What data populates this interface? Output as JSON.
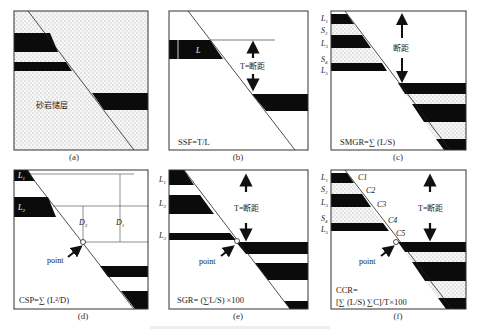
{
  "figure": {
    "panels": [
      {
        "id": "a",
        "caption": "(a)",
        "label": "砂岩储层"
      },
      {
        "id": "b",
        "caption": "(b)",
        "bed_label": "L",
        "throw_label": "T=断距",
        "formula": "SSF=T/L"
      },
      {
        "id": "c",
        "caption": "(c)",
        "layer_labels": [
          "L1",
          "S2",
          "L3",
          "S4",
          "L5"
        ],
        "throw_label": "断距",
        "formula": "SMGR=∑ (L/S)"
      },
      {
        "id": "d",
        "caption": "(d)",
        "layer_labels": [
          "L1",
          "L2"
        ],
        "distance_labels": [
          "D2",
          "D1"
        ],
        "point_label": "point",
        "formula": "CSP=∑ (L²/D)"
      },
      {
        "id": "e",
        "caption": "(e)",
        "layer_labels": [
          "L1",
          "L2",
          "L3"
        ],
        "throw_label": "T=断距",
        "point_label": "point",
        "formula": "SGR= (∑L/S) ×100"
      },
      {
        "id": "f",
        "caption": "(f)",
        "layer_labels": [
          "L1",
          "S2",
          "L3",
          "S4",
          "L5"
        ],
        "contact_labels": [
          "C1",
          "C2",
          "C3",
          "C4",
          "C5"
        ],
        "throw_label": "T=断距",
        "point_label": "point",
        "formula_line1": "CCR=",
        "formula_line2": "[∑ (L/S) ∑C]/T×100"
      }
    ]
  },
  "labels": {
    "a_sand": "砂岩储层",
    "b_L": "L",
    "b_T": "T=断距",
    "b_formula": "SSF=T/L",
    "c_L1": "L",
    "c_L1s": "1",
    "c_S2": "S",
    "c_S2s": "2",
    "c_L3": "L",
    "c_L3s": "3",
    "c_S4": "S",
    "c_S4s": "4",
    "c_L5": "L",
    "c_L5s": "5",
    "c_throw": "断距",
    "c_formula": "SMGR=∑ (L/S)",
    "d_L1": "L",
    "d_L1s": "1",
    "d_L2": "L",
    "d_L2s": "2",
    "d_D2": "D",
    "d_D2s": "2",
    "d_D1": "D",
    "d_D1s": "1",
    "d_point": "point",
    "d_formula": "CSP=∑ (L²/D)",
    "e_L1": "L",
    "e_L1s": "1",
    "e_L2": "L",
    "e_L2s": "2",
    "e_L3": "L",
    "e_L3s": "3",
    "e_T": "T=断距",
    "e_point": "point",
    "e_formula": "SGR= (∑L/S) ×100",
    "f_L1": "L",
    "f_L1s": "1",
    "f_S2": "S",
    "f_S2s": "2",
    "f_L3": "L",
    "f_L3s": "3",
    "f_S4": "S",
    "f_S4s": "4",
    "f_L5": "L",
    "f_L5s": "5",
    "f_C1": "C1",
    "f_C2": "C2",
    "f_C3": "C3",
    "f_C4": "C4",
    "f_C5": "C5",
    "f_T": "T=断距",
    "f_point": "point",
    "f_formula1": "CCR=",
    "f_formula2": "[∑ (L/S) ∑C]/T×100"
  },
  "captions": {
    "a": "(a)",
    "b": "(b)",
    "c": "(c)",
    "d": "(d)",
    "e": "(e)",
    "f": "(f)"
  },
  "colors": {
    "shale": "#0b0b0b",
    "sand_bg": "#f4f4f4",
    "frame": "#333333",
    "text": "#222222"
  }
}
